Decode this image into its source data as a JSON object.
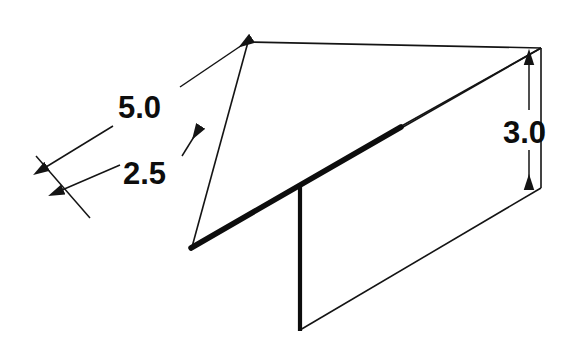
{
  "drawing": {
    "title": "Isometric T-section dimension drawing",
    "type": "engineering-isometric-sketch",
    "units": "unitless",
    "stroke_color": "#141414",
    "background_color": "#ffffff",
    "thick_edge_color": "#0d0d0d"
  },
  "dimensions": [
    {
      "id": "length-overall",
      "label": "5.0",
      "text_x": 118,
      "text_y": 118,
      "describes": "overall length of the horizontal plate along the left-front edge"
    },
    {
      "id": "length-partial",
      "label": "2.5",
      "text_x": 123,
      "text_y": 184,
      "describes": "distance from the left-front edge to the vertical fin"
    },
    {
      "id": "height-vertical",
      "label": "3.0",
      "text_x": 503,
      "text_y": 143,
      "describes": "height of the vertical plate measured at the right end"
    }
  ],
  "geometry": {
    "horizontal_plate": {
      "name": "top-parallelogram",
      "vertices": [
        {
          "x": 192,
          "y": 247
        },
        {
          "x": 248,
          "y": 42
        },
        {
          "x": 541,
          "y": 48
        },
        {
          "x": 398,
          "y": 128
        }
      ]
    },
    "vertical_plate": {
      "name": "bottom-parallelogram",
      "vertices": [
        {
          "x": 300,
          "y": 186
        },
        {
          "x": 541,
          "y": 48
        },
        {
          "x": 541,
          "y": 188
        },
        {
          "x": 300,
          "y": 330
        }
      ]
    },
    "thick_fold_edge": {
      "name": "fold-edge",
      "from": {
        "x": 192,
        "y": 247
      },
      "to": {
        "x": 400,
        "y": 127
      },
      "stroke_width": 5
    },
    "fin_edge": {
      "name": "vertical-fin-edge",
      "from": {
        "x": 300,
        "y": 186
      },
      "to": {
        "x": 300,
        "y": 330
      },
      "stroke_width": 4
    }
  },
  "leaders": {
    "ext_left": {
      "from": {
        "x": 38,
        "y": 160
      },
      "to": {
        "x": 88,
        "y": 215
      }
    },
    "dim_5_line": {
      "from": {
        "x": 44,
        "y": 166
      },
      "to": {
        "x": 252,
        "y": 38
      }
    },
    "dim_2_5_line": {
      "from": {
        "x": 60,
        "y": 187
      },
      "to": {
        "x": 198,
        "y": 128
      }
    },
    "dim_3_line": {
      "from": {
        "x": 529,
        "y": 63
      },
      "to": {
        "x": 529,
        "y": 190
      }
    }
  }
}
